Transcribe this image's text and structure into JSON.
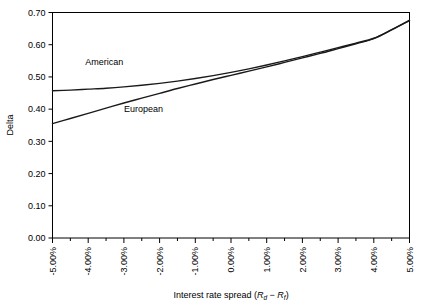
{
  "chart_data": {
    "type": "line",
    "title": "",
    "xlabel": "Interest rate spread (Rd − Rf)",
    "xlabel_parts": {
      "prefix": "Interest rate spread (",
      "r1": "R",
      "sub1": "d",
      "minus": " − ",
      "r2": "R",
      "sub2": "f",
      "suffix": ")"
    },
    "ylabel": "Delta",
    "xlim": [
      -5,
      5
    ],
    "ylim": [
      0.0,
      0.7
    ],
    "grid": false,
    "legend_position": "inline-annotation",
    "x_tick_labels": [
      "-5.00%",
      "-4.00%",
      "-3.00%",
      "-2.00%",
      "-1.00%",
      "0.00%",
      "1.00%",
      "2.00%",
      "3.00%",
      "4.00%",
      "5.00%"
    ],
    "x_tick_values": [
      -5,
      -4,
      -3,
      -2,
      -1,
      0,
      1,
      2,
      3,
      4,
      5
    ],
    "x_minor_ticks": [
      -4.5,
      -3.5,
      -2.5,
      -1.5,
      -0.5,
      0.5,
      1.5,
      2.5,
      3.5,
      4.5
    ],
    "y_tick_labels": [
      "0.00",
      "0.10",
      "0.20",
      "0.30",
      "0.40",
      "0.50",
      "0.60",
      "0.70"
    ],
    "y_tick_values": [
      0.0,
      0.1,
      0.2,
      0.3,
      0.4,
      0.5,
      0.6,
      0.7
    ],
    "x": [
      -5,
      -4.5,
      -4,
      -3.5,
      -3,
      -2.5,
      -2,
      -1.5,
      -1,
      -0.5,
      0,
      0.5,
      1,
      1.5,
      2,
      2.5,
      3,
      3.5,
      4,
      4.5,
      5
    ],
    "series": [
      {
        "name": "American",
        "color": "#1a1a1a",
        "label_x": -3.55,
        "label_y": 0.537,
        "values": [
          0.457,
          0.459,
          0.462,
          0.465,
          0.469,
          0.474,
          0.48,
          0.487,
          0.495,
          0.504,
          0.514,
          0.525,
          0.537,
          0.55,
          0.563,
          0.577,
          0.591,
          0.605,
          0.62,
          0.647,
          0.676
        ]
      },
      {
        "name": "European",
        "color": "#1a1a1a",
        "label_x": -2.45,
        "label_y": 0.392,
        "values": [
          0.355,
          0.371,
          0.387,
          0.403,
          0.419,
          0.434,
          0.449,
          0.464,
          0.478,
          0.492,
          0.505,
          0.518,
          0.531,
          0.545,
          0.559,
          0.573,
          0.588,
          0.603,
          0.619,
          0.646,
          0.675
        ]
      }
    ],
    "annotations": [
      {
        "text": "American",
        "x": -3.55,
        "y": 0.537
      },
      {
        "text": "European",
        "x": -2.45,
        "y": 0.392
      }
    ]
  },
  "figure": {
    "background_color": "#ffffff",
    "axis_color": "#000000",
    "line_color": "#1a1a1a"
  }
}
